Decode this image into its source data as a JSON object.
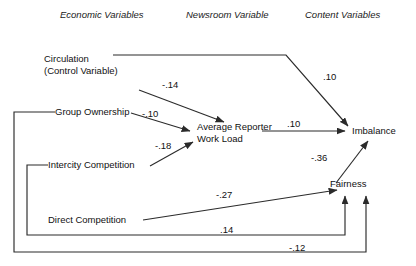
{
  "headers": [
    {
      "label": "Economic Variables",
      "x": 60,
      "y": 9
    },
    {
      "label": "Newsroom Variable",
      "x": 186,
      "y": 9
    },
    {
      "label": "Content Variables",
      "x": 305,
      "y": 9
    }
  ],
  "nodes": [
    {
      "id": "circulation",
      "line1": "Circulation",
      "line2": "(Control Variable)",
      "x": 44,
      "y": 53
    },
    {
      "id": "group_ownership",
      "line1": "Group Ownership",
      "line2": "",
      "x": 55,
      "y": 111
    },
    {
      "id": "intercity_competition",
      "line1": "Intercity Competition",
      "line2": "",
      "x": 48,
      "y": 157
    },
    {
      "id": "direct_competition",
      "line1": "Direct Competition",
      "line2": "",
      "x": 48,
      "y": 216
    },
    {
      "id": "work_load",
      "line1": "Average Reporter",
      "line2": "Work Load",
      "x": 197,
      "y": 121
    },
    {
      "id": "imbalance",
      "line1": "Imbalance",
      "line2": "",
      "x": 355,
      "y": 132
    },
    {
      "id": "fairness",
      "line1": "Fairness",
      "line2": "",
      "x": 352,
      "y": 184
    }
  ],
  "coefficients": [
    {
      "id": "circ-imbalance",
      "value": ".10",
      "x": 323,
      "y": 71,
      "from": "circulation",
      "to": "imbalance"
    },
    {
      "id": "circ-workload",
      "value": "-.14",
      "x": 162,
      "y": 79,
      "from": "circulation",
      "to": "work_load"
    },
    {
      "id": "group-workload",
      "value": "-.10",
      "x": 142,
      "y": 108,
      "from": "group_ownership",
      "to": "work_load"
    },
    {
      "id": "intercity-workload",
      "value": "-.18",
      "x": 155,
      "y": 140,
      "from": "intercity_competition",
      "to": "work_load"
    },
    {
      "id": "workload-imbalance",
      "value": ".10",
      "x": 287,
      "y": 118,
      "from": "work_load",
      "to": "imbalance"
    },
    {
      "id": "fairness-imbalance",
      "value": "-.36",
      "x": 311,
      "y": 152,
      "from": "fairness",
      "to": "imbalance"
    },
    {
      "id": "direct-fairness",
      "value": "-.27",
      "x": 216,
      "y": 189,
      "from": "direct_competition",
      "to": "fairness"
    },
    {
      "id": "intercity-fairness",
      "value": ".14",
      "x": 220,
      "y": 224,
      "from": "intercity_competition",
      "to": "fairness"
    },
    {
      "id": "group-fairness",
      "value": "-.12",
      "x": 289,
      "y": 242,
      "from": "group_ownership",
      "to": "fairness"
    }
  ],
  "colors": {
    "line": "#2b2b2b",
    "text": "#111111",
    "background": "#ffffff"
  }
}
